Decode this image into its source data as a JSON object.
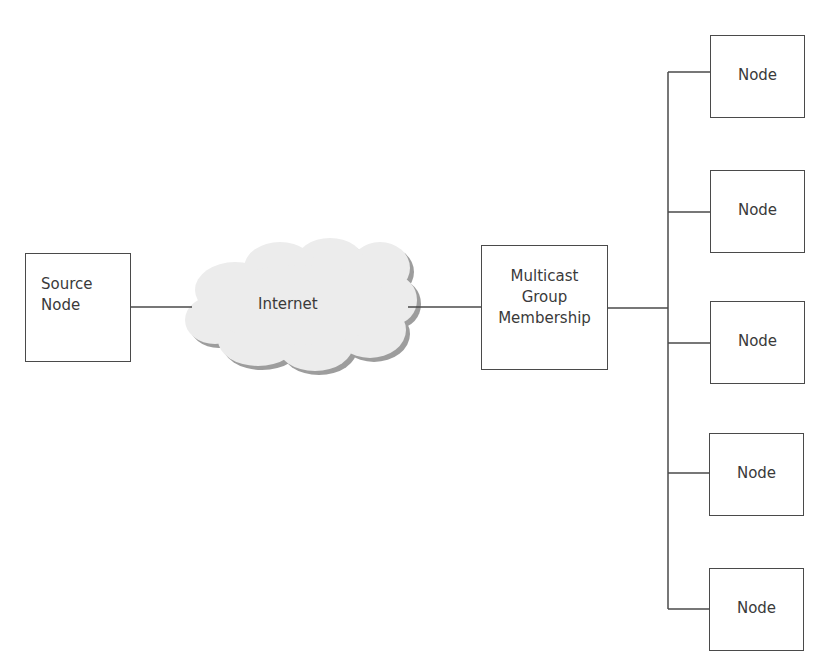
{
  "diagram": {
    "type": "network-topology",
    "source": {
      "label": "Source Node"
    },
    "cloud": {
      "label": "Internet",
      "icon": "cloud-icon"
    },
    "group": {
      "label": "Multicast Group Membership",
      "lines": [
        "Multicast",
        "Group",
        "Membership"
      ]
    },
    "nodes": [
      {
        "label": "Node"
      },
      {
        "label": "Node"
      },
      {
        "label": "Node"
      },
      {
        "label": "Node"
      },
      {
        "label": "Node"
      }
    ],
    "edges": [
      {
        "from": "Source Node",
        "to": "Internet"
      },
      {
        "from": "Internet",
        "to": "Multicast Group Membership"
      },
      {
        "from": "Multicast Group Membership",
        "to": "Node",
        "fanout": 5
      }
    ],
    "colors": {
      "stroke": "#4a4a4a",
      "text": "#3a3a3a",
      "cloud_fill": "#ececec",
      "cloud_shadow": "#9a9a9a"
    }
  }
}
